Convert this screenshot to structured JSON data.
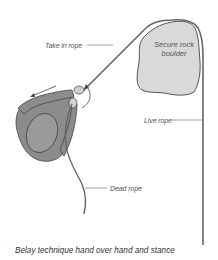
{
  "figure": {
    "caption": "Belay technique hand over hand and stance",
    "boulder": {
      "line1": "Secure rock",
      "line2": "boulder"
    },
    "labels": {
      "take_in_rope": "Take in rope",
      "live_rope": "Live rope",
      "dead_rope": "Dead rope"
    },
    "colors": {
      "boulder_fill": "#d9d9d9",
      "body_fill": "#8c8c8c",
      "helmet_fill": "#9a9a9a",
      "rope": "#666666",
      "leader_line": "#777777",
      "outline": "#444444"
    }
  }
}
